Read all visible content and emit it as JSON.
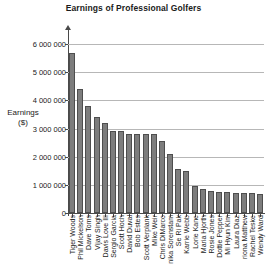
{
  "chart_data": {
    "type": "bar",
    "title": "Earnings of Professional Golfers",
    "xlabel": "",
    "ylabel": "Earnings\n($)",
    "ylabel_line1": "Earnings",
    "ylabel_line2": "($)",
    "ylim": [
      0,
      6500000
    ],
    "ytick_values": [
      0,
      1000000,
      2000000,
      3000000,
      4000000,
      5000000,
      6000000
    ],
    "ytick_labels": [
      "0",
      "1 000 000",
      "2 000 000",
      "3 000 000",
      "4 000 000",
      "5 000 000",
      "6 000 000"
    ],
    "grid": true,
    "legend": null,
    "bar_color": "#7d7d7d",
    "bar_edge_color": "#4e4e4e",
    "axis_color": "#4a4a4a",
    "gridline_color": "#b7b7b7",
    "categories": [
      "Tiger Woods",
      "Phil Mickelson",
      "Dave Toms",
      "Vijay Singh",
      "Davis Love III",
      "Sergio Garcia",
      "Scott Hoch",
      "David Duval",
      "Bob Estes",
      "Scott Verplank",
      "Mike Weir",
      "Chris DiMarco",
      "nika Sorenstam",
      "Se Ri Pak",
      "Karrie Webb",
      "Lorie Kane",
      "Maria Hjorth",
      "Rosie Jones",
      "Dottie Pepper",
      "Mi Hyun Kim",
      "Laura Diaz",
      "riona Matthew",
      "Rachel Teske",
      "Wendy Ward"
    ],
    "values": [
      5700000,
      4400000,
      3800000,
      3400000,
      3200000,
      2900000,
      2900000,
      2800000,
      2800000,
      2800000,
      2800000,
      2550000,
      2080000,
      1550000,
      1480000,
      950000,
      840000,
      780000,
      760000,
      740000,
      720000,
      720000,
      700000,
      680000
    ]
  }
}
